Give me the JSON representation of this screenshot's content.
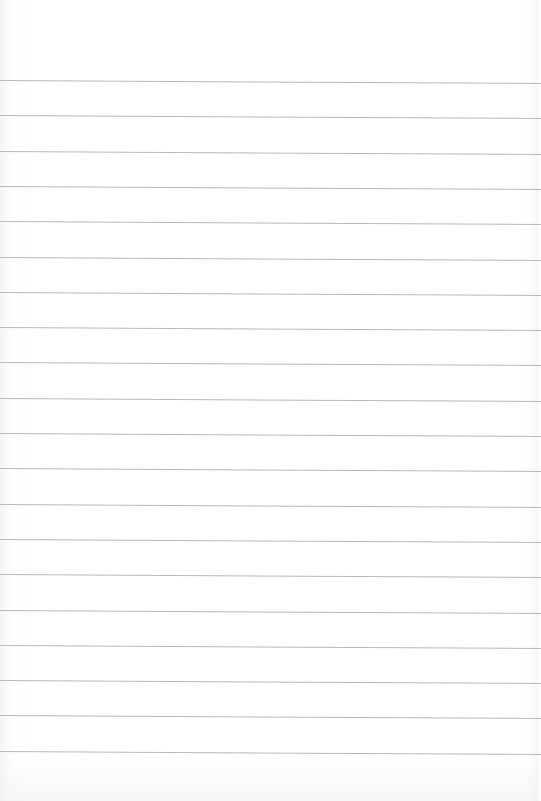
{
  "paper": {
    "type": "lined-paper",
    "line_count": 20,
    "first_line_y": 80,
    "line_spacing": 35.3,
    "line_color": "#b9b9b9",
    "background_color": "#ffffff"
  }
}
